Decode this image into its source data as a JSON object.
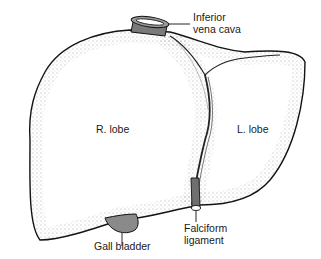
{
  "diagram": {
    "labels": {
      "inferior_vena_cava": "Inferior\nvena cava",
      "right_lobe": "R. lobe",
      "left_lobe": "L. lobe",
      "gall_bladder": "Gall bladder",
      "falciform_ligament": "Falciform\nligament"
    },
    "colors": {
      "outline": "#111111",
      "stipple": "#555555",
      "vessel_fill": "#7a7a7a",
      "gallbladder_fill": "#8a8a8a",
      "background": "#ffffff"
    }
  }
}
